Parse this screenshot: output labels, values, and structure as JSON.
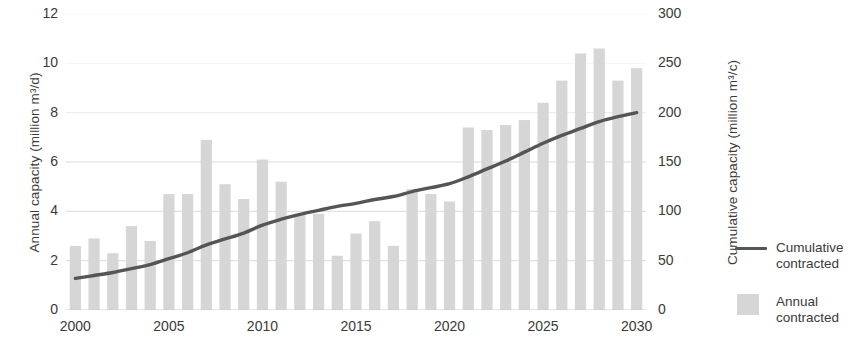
{
  "chart_data": {
    "type": "bar",
    "title": "",
    "subtitle": "",
    "xlabel": "",
    "ylabel": "Annual capacity (million m³/d)",
    "y2label": "Cumulative capacity (million m³/c)",
    "grid": true,
    "legend_position": "right",
    "x": [
      2000,
      2001,
      2002,
      2003,
      2004,
      2005,
      2006,
      2007,
      2008,
      2009,
      2010,
      2011,
      2012,
      2013,
      2014,
      2015,
      2016,
      2017,
      2018,
      2019,
      2020,
      2021,
      2022,
      2023,
      2024,
      2025,
      2026,
      2027,
      2028,
      2029,
      2030
    ],
    "categories": [
      "2000",
      "2001",
      "2002",
      "2003",
      "2004",
      "2005",
      "2006",
      "2007",
      "2008",
      "2009",
      "2010",
      "2011",
      "2012",
      "2013",
      "2014",
      "2015",
      "2016",
      "2017",
      "2018",
      "2019",
      "2020",
      "2021",
      "2022",
      "2023",
      "2024",
      "2025",
      "2026",
      "2027",
      "2028",
      "2029",
      "2030"
    ],
    "xtick_labels": [
      "2000",
      "2005",
      "2010",
      "2015",
      "2020",
      "2025",
      "2030"
    ],
    "xtick_values": [
      2000,
      2005,
      2010,
      2015,
      2020,
      2025,
      2030
    ],
    "ytick_labels": [
      "0",
      "2",
      "4",
      "6",
      "8",
      "10",
      "12"
    ],
    "ytick_values": [
      0,
      2,
      4,
      6,
      8,
      10,
      12
    ],
    "ylim": [
      0,
      12
    ],
    "y2tick_labels": [
      "0",
      "50",
      "100",
      "150",
      "200",
      "250",
      "300"
    ],
    "y2tick_values": [
      0,
      50,
      100,
      150,
      200,
      250,
      300
    ],
    "y2lim": [
      0,
      300
    ],
    "series": [
      {
        "name": "Annual contracted",
        "type": "bar",
        "axis": "left",
        "color": "#d6d6d6",
        "values": [
          2.6,
          2.9,
          2.3,
          3.4,
          2.8,
          4.7,
          4.7,
          6.9,
          5.1,
          4.5,
          6.1,
          5.2,
          3.9,
          3.9,
          2.2,
          3.1,
          3.6,
          2.6,
          4.9,
          4.7,
          4.4,
          7.4,
          7.3,
          7.5,
          7.7,
          8.4,
          9.3,
          10.4,
          10.6,
          9.3,
          9.8
        ]
      },
      {
        "name": "Cumulative contracted",
        "type": "line",
        "axis": "right",
        "color": "#555555",
        "values": [
          32,
          35,
          38,
          42,
          46,
          52,
          58,
          66,
          72,
          78,
          86,
          92,
          97,
          101,
          105,
          108,
          112,
          115,
          120,
          124,
          128,
          135,
          143,
          151,
          160,
          169,
          177,
          184,
          191,
          196,
          200
        ]
      }
    ]
  },
  "axes": {
    "left_title": "Annual capacity (million m³/d)",
    "right_title": "Cumulative capacity (million m³/c)"
  },
  "legend": {
    "items": [
      {
        "key": "line",
        "label_line1": "Cumulative",
        "label_line2": "contracted"
      },
      {
        "key": "swatch",
        "label_line1": "Annual",
        "label_line2": "contracted"
      }
    ]
  },
  "colors": {
    "bar": "#d6d6d6",
    "line": "#555555",
    "grid": "#d9d9d9",
    "text": "#3a3a3a",
    "background": "#ffffff"
  }
}
